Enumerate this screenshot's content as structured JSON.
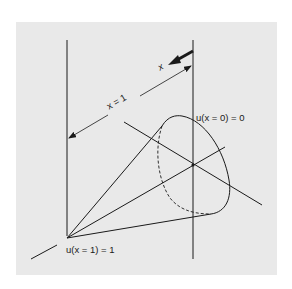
{
  "figure": {
    "type": "cone-diagram",
    "background_color": "#e9e9e9",
    "line_color": "#1a1a1a",
    "labels": {
      "x_arrow": "x",
      "dimension": "x = 1",
      "u_at_0": "u(x = 0) = 0",
      "u_at_1": "u(x = 1) = 1"
    },
    "elements": [
      "left-vertical-plane-line",
      "right-vertical-plane-line",
      "x-direction-arrow",
      "dimension-line-x-equals-1",
      "cone-lateral-edges",
      "cone-base-ellipse",
      "hidden-base-edge-dashed",
      "axis-line",
      "transverse-line",
      "center-point"
    ]
  }
}
